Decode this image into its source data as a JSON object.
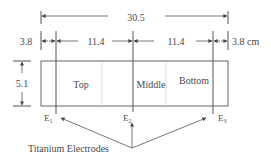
{
  "diagram": {
    "type": "cell dimension schematic",
    "units": "cm",
    "overall_width": {
      "label": "30.5"
    },
    "segments": [
      {
        "name": "left-margin",
        "label": "3.8"
      },
      {
        "name": "left-span",
        "label": "11.4"
      },
      {
        "name": "right-span",
        "label": "11.4"
      },
      {
        "name": "right-margin",
        "label": "3.8 cm"
      }
    ],
    "height": {
      "label": "5.1"
    },
    "regions": [
      {
        "name": "top",
        "label": "Top"
      },
      {
        "name": "middle",
        "label": "Middle"
      },
      {
        "name": "bottom",
        "label": "Bottom"
      }
    ],
    "electrodes": [
      {
        "name": "E1",
        "letter": "E",
        "sub": "1"
      },
      {
        "name": "E2",
        "letter": "E",
        "sub": "2"
      },
      {
        "name": "E3",
        "letter": "E",
        "sub": "3"
      }
    ],
    "callout": {
      "label": "Titanium Electrodes"
    },
    "colors": {
      "line": "#555555",
      "faint": "#cfcfcf",
      "text": "#4a4a4a"
    }
  }
}
